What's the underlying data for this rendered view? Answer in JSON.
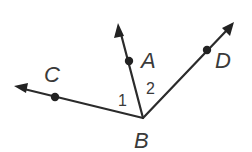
{
  "diagram": {
    "vertex": {
      "label": "B",
      "x": 143,
      "y": 118,
      "label_x": 134,
      "label_y": 148
    },
    "rays": [
      {
        "name": "ray-BA",
        "point": {
          "label": "A",
          "x": 129,
          "y": 61
        },
        "tip": {
          "x": 118,
          "y": 24
        },
        "label_x": 141,
        "label_y": 68
      },
      {
        "name": "ray-BC",
        "point": {
          "label": "C",
          "x": 55,
          "y": 97
        },
        "tip": {
          "x": 14,
          "y": 86
        },
        "label_x": 44,
        "label_y": 82
      },
      {
        "name": "ray-BD",
        "point": {
          "label": "D",
          "x": 207,
          "y": 50
        },
        "tip": {
          "x": 234,
          "y": 22
        },
        "label_x": 215,
        "label_y": 68
      }
    ],
    "angle_labels": [
      {
        "label": "1",
        "x": 118,
        "y": 106
      },
      {
        "label": "2",
        "x": 146,
        "y": 94
      }
    ],
    "colors": {
      "line": "#2b2b2b",
      "text": "#3a3a3a",
      "background": "#ffffff"
    }
  }
}
